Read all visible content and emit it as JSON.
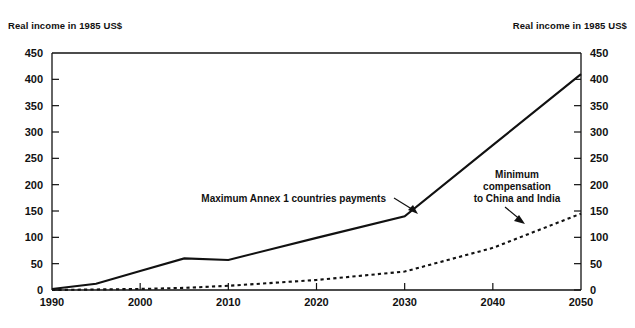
{
  "chart_data": {
    "type": "line",
    "title": "",
    "left_axis_title": "Real income in 1985 US$",
    "right_axis_title": "Real income in 1985 US$",
    "xlabel": "",
    "ylabel": "Real income in 1985 US$",
    "xlim": [
      1990,
      2050
    ],
    "ylim": [
      0,
      450
    ],
    "grid": false,
    "legend": "none (inline annotations)",
    "x_ticks": [
      "1990",
      "2000",
      "2010",
      "2020",
      "2030",
      "2040",
      "2050"
    ],
    "y_ticks": [
      "0",
      "50",
      "100",
      "150",
      "200",
      "250",
      "300",
      "350",
      "400",
      "450"
    ],
    "y_ticks_right": [
      "0",
      "50",
      "100",
      "150",
      "200",
      "250",
      "300",
      "350",
      "400",
      "450"
    ],
    "x": [
      1990,
      1995,
      2000,
      2005,
      2010,
      2020,
      2030,
      2040,
      2050
    ],
    "series": [
      {
        "name": "Maximum Annex 1 countries payments",
        "style": "solid",
        "values": [
          2,
          12,
          36,
          60,
          57,
          99,
          140,
          275,
          410
        ]
      },
      {
        "name": "Minimum compensation to China and India",
        "style": "dashed",
        "values": [
          0,
          1,
          2,
          4,
          8,
          19,
          35,
          80,
          145
        ]
      }
    ],
    "annotations": [
      {
        "id": "annotation-max-annex1",
        "text": "Maximum Annex 1 countries payments",
        "lines": [
          "Maximum Annex 1 countries payments"
        ],
        "points_to_series": "Maximum Annex 1 countries payments",
        "points_to_x": 2030,
        "points_to_y": 140
      },
      {
        "id": "annotation-min-compensation",
        "text": "Minimum compensation to China and India",
        "lines": [
          "Minimum",
          "compensation",
          "to China and India"
        ],
        "points_to_series": "Minimum compensation to China and India",
        "points_to_x": 2046,
        "points_to_y": 120
      }
    ]
  },
  "colors": {
    "background": "#ffffff",
    "ink": "#111111",
    "series_solid": "#111111",
    "series_dashed": "#111111"
  }
}
